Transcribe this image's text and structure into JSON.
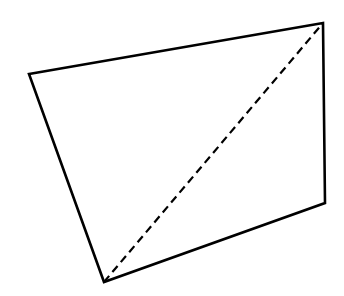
{
  "diagram": {
    "type": "quadrilateral-with-diagonal",
    "stroke_color": "#000000",
    "background": "#ffffff",
    "vertices": [
      {
        "id": "A",
        "x": 29,
        "y": 74
      },
      {
        "id": "B",
        "x": 323,
        "y": 23
      },
      {
        "id": "C",
        "x": 325,
        "y": 203
      },
      {
        "id": "D",
        "x": 104,
        "y": 282
      }
    ],
    "edges": [
      {
        "from": "A",
        "to": "B",
        "style": "solid"
      },
      {
        "from": "B",
        "to": "C",
        "style": "solid"
      },
      {
        "from": "C",
        "to": "D",
        "style": "solid"
      },
      {
        "from": "D",
        "to": "A",
        "style": "solid"
      }
    ],
    "diagonal": {
      "from": "D",
      "to": "B",
      "style": "dashed"
    }
  }
}
